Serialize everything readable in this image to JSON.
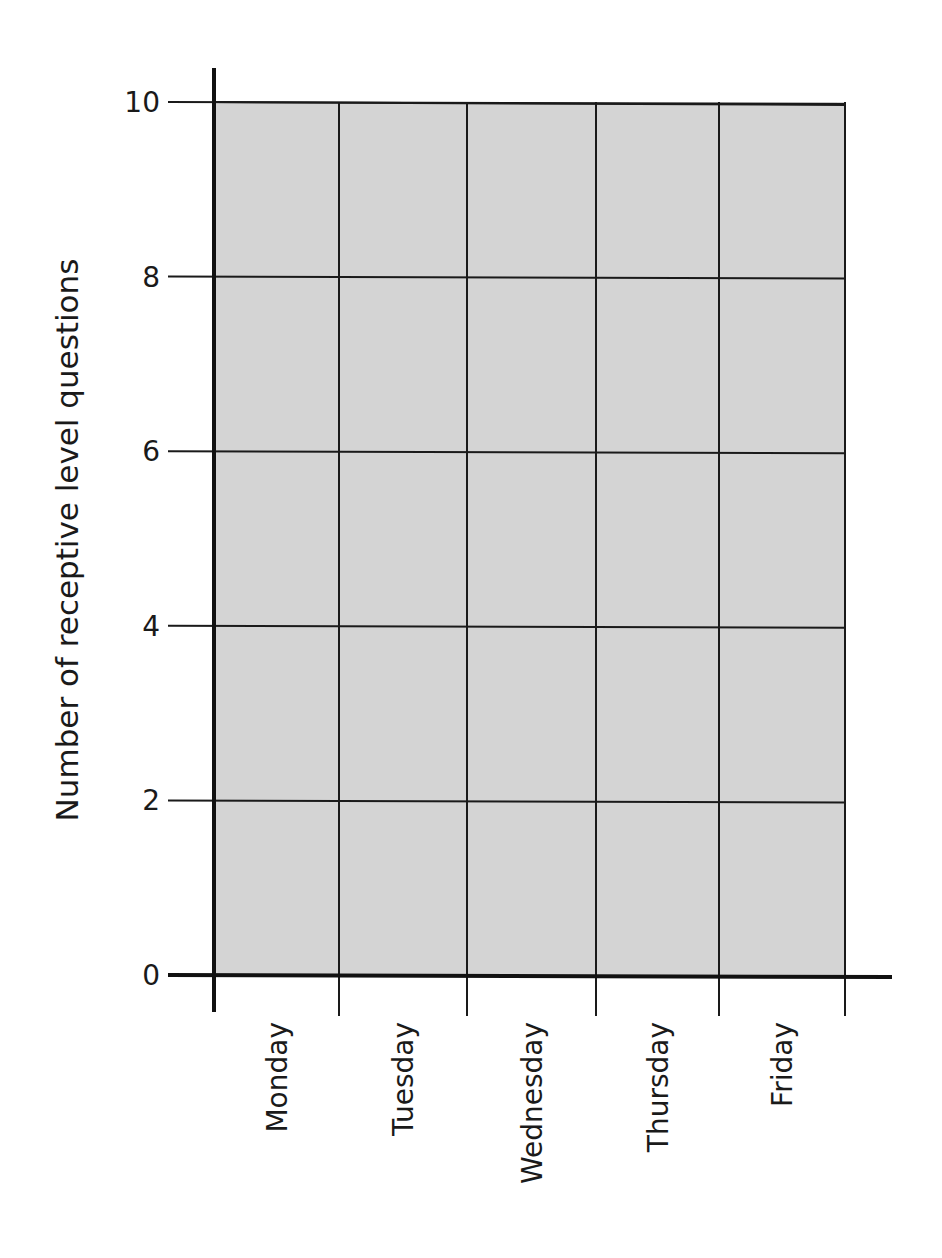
{
  "chart_data": {
    "type": "bar",
    "title": "",
    "xlabel": "",
    "ylabel": "Number of receptive level questions",
    "categories": [
      "Monday",
      "Tuesday",
      "Wednesday",
      "Thursday",
      "Friday"
    ],
    "values": [
      null,
      null,
      null,
      null,
      null
    ],
    "yticks": [
      0,
      2,
      4,
      6,
      8,
      10
    ],
    "ylim": [
      0,
      10
    ],
    "grid": true,
    "legend": null,
    "note": "Blank bar-chart template; no bars are drawn"
  },
  "style": {
    "plot_bg": "#d4d4d4",
    "grid_color": "#1a1a1a",
    "axis_color": "#111111",
    "text_color": "#1a1a1a"
  }
}
